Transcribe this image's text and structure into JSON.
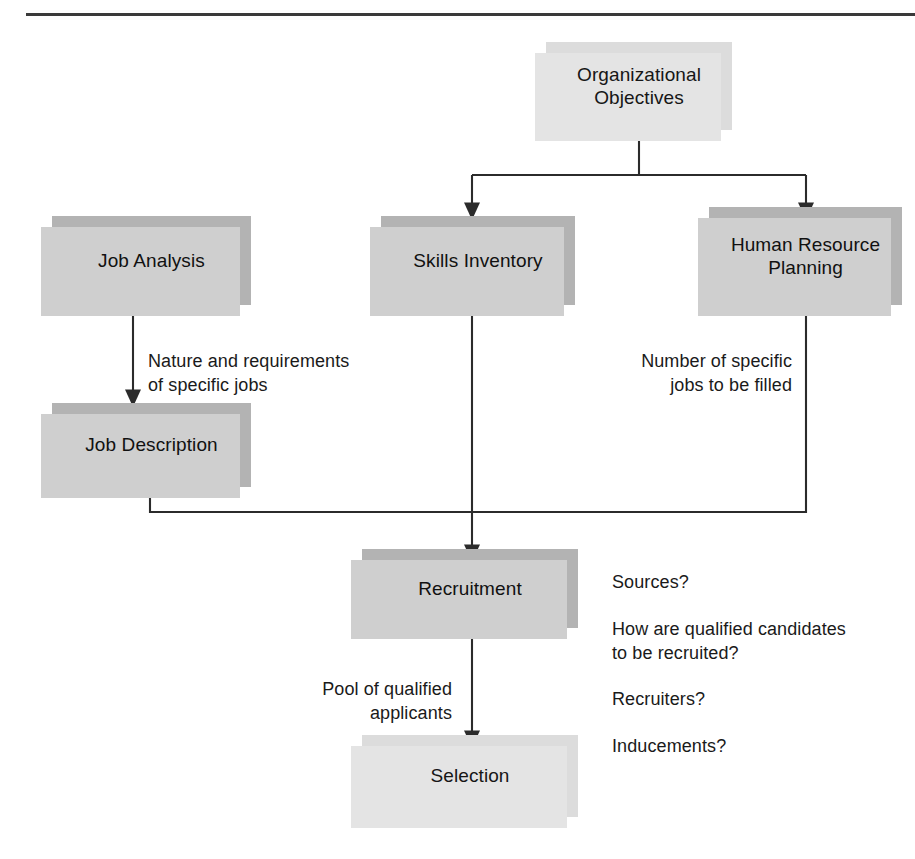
{
  "diagram": {
    "colors": {
      "box_light": "#dcdcdc",
      "box_dark": "#b3b3b3",
      "shadow_light": "#e4e4e4",
      "shadow_dark": "#cfcfcf",
      "line": "#2b2b2b",
      "text": "#1a1a1a",
      "rule": "#3a3a3a",
      "background": "#ffffff"
    },
    "nodes": [
      {
        "id": "organizational-objectives",
        "label": "Organizational\nObjectives",
        "tone": "light"
      },
      {
        "id": "job-analysis",
        "label": "Job Analysis",
        "tone": "dark"
      },
      {
        "id": "skills-inventory",
        "label": "Skills Inventory",
        "tone": "dark"
      },
      {
        "id": "human-resource-planning",
        "label": "Human Resource\nPlanning",
        "tone": "dark"
      },
      {
        "id": "job-description",
        "label": "Job Description",
        "tone": "dark"
      },
      {
        "id": "recruitment",
        "label": "Recruitment",
        "tone": "dark"
      },
      {
        "id": "selection",
        "label": "Selection",
        "tone": "light"
      }
    ],
    "annotations": [
      {
        "id": "nature-and-requirements",
        "text": "Nature and requirements\nof specific jobs"
      },
      {
        "id": "number-of-specific-jobs",
        "text": "Number of specific\njobs to be filled"
      },
      {
        "id": "pool-of-qualified-applicants",
        "text": "Pool of qualified\napplicants"
      }
    ],
    "recruitment_questions": [
      "Sources?",
      "How are qualified candidates\n     to be recruited?",
      "Recruiters?",
      "Inducements?"
    ],
    "edges": [
      {
        "from": "organizational-objectives",
        "to": "skills-inventory",
        "arrow": true
      },
      {
        "from": "organizational-objectives",
        "to": "human-resource-planning",
        "arrow": true
      },
      {
        "from": "job-analysis",
        "to": "job-description",
        "arrow": true
      },
      {
        "from": "skills-inventory",
        "to": "recruitment",
        "arrow": true
      },
      {
        "from": "human-resource-planning",
        "to": "recruitment",
        "arrow": true
      },
      {
        "from": "job-description",
        "to": "recruitment",
        "arrow": true
      },
      {
        "from": "recruitment",
        "to": "selection",
        "arrow": true
      }
    ]
  }
}
